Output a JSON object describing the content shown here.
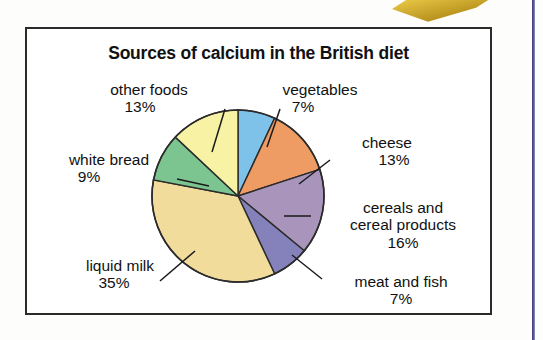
{
  "figure": {
    "title": "Sources of calcium in the British diet",
    "frame_border_color": "#2b2b2b",
    "background_color": "#ffffff"
  },
  "artifacts": {
    "gold_bleed_name": "gold-scan-bleed",
    "right_rule_color": "#4a4690"
  },
  "chart_data": {
    "type": "pie",
    "title": "Sources of calcium in the British diet",
    "xlabel": "",
    "ylabel": "",
    "units": "percent",
    "start_angle_deg": 0,
    "direction": "clockwise",
    "legend_position": "none",
    "labels_position": "outside-with-leader-lines",
    "categories": [
      "vegetables",
      "cheese",
      "cereals and cereal products",
      "meat and fish",
      "liquid milk",
      "white bread",
      "other foods"
    ],
    "values": [
      7,
      13,
      16,
      7,
      35,
      9,
      13
    ],
    "colors": [
      "#7ec2ea",
      "#ef9c64",
      "#a995bb",
      "#8582bb",
      "#f1dc9c",
      "#7cc590",
      "#f8f2a4"
    ],
    "slices": [
      {
        "name": "vegetables",
        "label_line1": "vegetables",
        "label_line2": "7%",
        "percent": 7,
        "color": "#7ec2ea"
      },
      {
        "name": "cheese",
        "label_line1": "cheese",
        "label_line2": "13%",
        "percent": 13,
        "color": "#ef9c64"
      },
      {
        "name": "cereals and cereal products",
        "label_line1": "cereals and",
        "label_line2": "cereal products",
        "label_line3": "16%",
        "percent": 16,
        "color": "#a995bb"
      },
      {
        "name": "meat and fish",
        "label_line1": "meat and fish",
        "label_line2": "7%",
        "percent": 7,
        "color": "#8582bb"
      },
      {
        "name": "liquid milk",
        "label_line1": "liquid milk",
        "label_line2": "35%",
        "percent": 35,
        "color": "#f1dc9c"
      },
      {
        "name": "white bread",
        "label_line1": "white bread",
        "label_line2": "9%",
        "percent": 9,
        "color": "#7cc590"
      },
      {
        "name": "other foods",
        "label_line1": "other foods",
        "label_line2": "13%",
        "percent": 13,
        "color": "#f8f2a4"
      }
    ]
  }
}
